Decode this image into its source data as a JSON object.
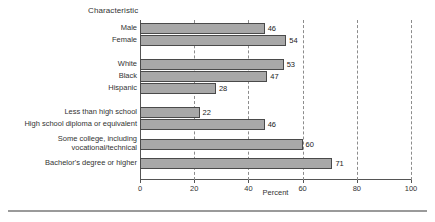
{
  "chart_data": {
    "type": "bar",
    "orientation": "horizontal",
    "title": "Characteristic",
    "xlabel": "Percent",
    "ylabel": "",
    "xlim": [
      0,
      100
    ],
    "xticks": [
      0,
      20,
      40,
      60,
      80,
      100
    ],
    "xticklabels": [
      "0",
      "20",
      "40",
      "60",
      "80",
      "100"
    ],
    "grid": "vertical-dashed",
    "legend": "none",
    "bar_color": "#a8a8a8",
    "bar_edge_color": "#4a4a4a",
    "categories": [
      "Male",
      "Female",
      "White",
      "Black",
      "Hispanic",
      "Less than high school",
      "High school diploma or equivalent",
      "Some college, including\nvocational/technical",
      "Bachelor's degree or higher"
    ],
    "values": [
      46,
      54,
      53,
      47,
      28,
      22,
      46,
      60,
      71
    ],
    "value_labels": [
      "46",
      "54",
      "53",
      "47",
      "28",
      "22",
      "46",
      "60",
      "71"
    ],
    "groups": [
      {
        "name": "Sex",
        "categories": [
          "Male",
          "Female"
        ]
      },
      {
        "name": "Race/ethnicity",
        "categories": [
          "White",
          "Black",
          "Hispanic"
        ]
      },
      {
        "name": "Education",
        "categories": [
          "Less than high school",
          "High school diploma or equivalent",
          "Some college, including vocational/technical",
          "Bachelor's degree or higher"
        ]
      }
    ]
  },
  "footer": {
    "caption": ""
  }
}
